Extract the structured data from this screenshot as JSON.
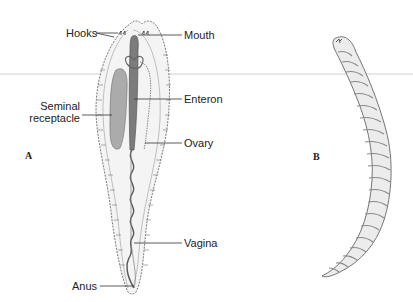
{
  "figure": {
    "panels": [
      {
        "id": "A",
        "label": "A"
      },
      {
        "id": "B",
        "label": "B"
      }
    ],
    "labels": {
      "hooks": "Hooks",
      "mouth": "Mouth",
      "enteron": "Enteron",
      "seminal_line1": "Seminal",
      "seminal_line2": "receptacle",
      "ovary": "Ovary",
      "vagina": "Vagina",
      "anus": "Anus"
    },
    "colors": {
      "outline": "#555555",
      "body_fill": "#f3f3f3",
      "receptacle_fill": "#a8a8a8",
      "enteron_fill": "#7a7a7a",
      "leader_line": "#333333",
      "divider": "#cfcfcf"
    }
  }
}
